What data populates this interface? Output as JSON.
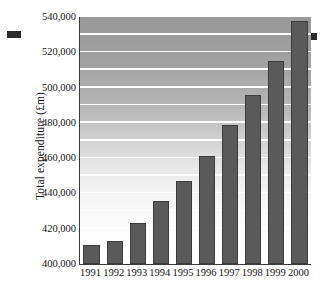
{
  "chart_data": {
    "type": "bar",
    "title": "",
    "subtitle": "",
    "xlabel": "",
    "ylabel": "Total expenditure (£m)",
    "categories": [
      "1991",
      "1992",
      "1993",
      "1994",
      "1995",
      "1996",
      "1997",
      "1998",
      "1999",
      "2000"
    ],
    "values": [
      411000,
      413000,
      423500,
      435500,
      447000,
      461000,
      479000,
      496000,
      515000,
      538000
    ],
    "ylim": [
      400000,
      540000
    ],
    "ytick_labels": [
      "400,000",
      "420,000",
      "440,000",
      "460,000",
      "480,000",
      "500,000",
      "520,000",
      "540,000"
    ],
    "ytick_values": [
      400000,
      420000,
      440000,
      460000,
      480000,
      500000,
      520000,
      540000
    ],
    "gridlines": true,
    "gridline_interval": 10000,
    "gridline_color": "#ffffff",
    "legend": "none",
    "bar_color": "#5a5a5a",
    "bar_border_color": "#3c3c3c",
    "axis_color": "#3a3a3a",
    "plot_background": "vertical gradient dark-gray to white"
  },
  "artifacts": {
    "left_mark": "",
    "right_mark": ""
  }
}
